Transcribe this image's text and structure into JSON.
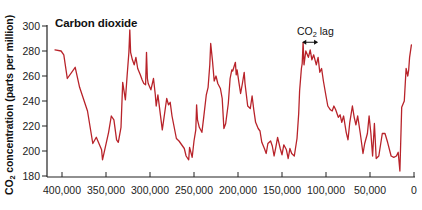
{
  "chart_data": {
    "type": "line",
    "title": "Carbon dioxide",
    "xlabel": "",
    "ylabel_prefix": "CO",
    "ylabel_sub": "2",
    "ylabel_suffix": " concentration (parts per million)",
    "ylabel": "CO2 concentration (parts per million)",
    "x_units": "years before present",
    "x_reversed": true,
    "xlim": [
      0,
      400000
    ],
    "ylim": [
      180,
      300
    ],
    "grid": false,
    "legend": null,
    "x_ticks": [
      400000,
      350000,
      300000,
      250000,
      200000,
      150000,
      100000,
      50000,
      0
    ],
    "x_tick_labels": [
      "400,000",
      "350,000",
      "300,000",
      "250,000",
      "200,000",
      "150,000",
      "100,000",
      "50,000",
      "0"
    ],
    "y_ticks": [
      180,
      200,
      220,
      240,
      260,
      280,
      300
    ],
    "y_tick_labels": [
      "180",
      "200",
      "220",
      "240",
      "260",
      "280",
      "300"
    ],
    "line_color": "#b8232a",
    "annotation": {
      "text_prefix": "CO",
      "text_sub": "2",
      "text_suffix": " lag",
      "text": "CO2 lag",
      "arrow_from_years": 127000,
      "arrow_to_years": 109000,
      "arrow_ppm": 287
    },
    "series": [
      {
        "name": "CO2 concentration",
        "points": [
          [
            408000,
            281
          ],
          [
            401000,
            280
          ],
          [
            398000,
            277
          ],
          [
            394000,
            258
          ],
          [
            385000,
            267
          ],
          [
            380000,
            251
          ],
          [
            371000,
            232
          ],
          [
            365000,
            206
          ],
          [
            361000,
            211
          ],
          [
            355000,
            201
          ],
          [
            354000,
            193
          ],
          [
            347000,
            215
          ],
          [
            344000,
            228
          ],
          [
            341000,
            225
          ],
          [
            338000,
            209
          ],
          [
            336000,
            207
          ],
          [
            333000,
            219
          ],
          [
            331000,
            255
          ],
          [
            328000,
            241
          ],
          [
            326000,
            260
          ],
          [
            324000,
            279
          ],
          [
            323000,
            297
          ],
          [
            322000,
            279
          ],
          [
            320000,
            273
          ],
          [
            318000,
            269
          ],
          [
            316000,
            275
          ],
          [
            314000,
            266
          ],
          [
            311000,
            261
          ],
          [
            309000,
            257
          ],
          [
            307000,
            254
          ],
          [
            305000,
            253
          ],
          [
            304000,
            279
          ],
          [
            303000,
            258
          ],
          [
            302000,
            254
          ],
          [
            299000,
            249
          ],
          [
            296000,
            258
          ],
          [
            294000,
            245
          ],
          [
            293000,
            236
          ],
          [
            291000,
            245
          ],
          [
            286000,
            217
          ],
          [
            281000,
            242
          ],
          [
            279000,
            237
          ],
          [
            277000,
            239
          ],
          [
            275000,
            228
          ],
          [
            270000,
            210
          ],
          [
            267000,
            208
          ],
          [
            261000,
            202
          ],
          [
            259000,
            196
          ],
          [
            256000,
            193
          ],
          [
            255000,
            203
          ],
          [
            252000,
            195
          ],
          [
            250000,
            208
          ],
          [
            248000,
            217
          ],
          [
            247000,
            237
          ],
          [
            246000,
            225
          ],
          [
            244000,
            219
          ],
          [
            241000,
            215
          ],
          [
            239000,
            227
          ],
          [
            236000,
            245
          ],
          [
            234000,
            251
          ],
          [
            232000,
            269
          ],
          [
            231000,
            286
          ],
          [
            229000,
            272
          ],
          [
            227000,
            256
          ],
          [
            225000,
            260
          ],
          [
            223000,
            254
          ],
          [
            220000,
            250
          ],
          [
            218000,
            242
          ],
          [
            216000,
            218
          ],
          [
            214000,
            222
          ],
          [
            211000,
            238
          ],
          [
            209000,
            258
          ],
          [
            207000,
            265
          ],
          [
            206000,
            264
          ],
          [
            203000,
            271
          ],
          [
            202000,
            261
          ],
          [
            201000,
            265
          ],
          [
            199000,
            255
          ],
          [
            197000,
            246
          ],
          [
            195000,
            254
          ],
          [
            193000,
            263
          ],
          [
            192000,
            254
          ],
          [
            189000,
            236
          ],
          [
            186000,
            234
          ],
          [
            184000,
            244
          ],
          [
            182000,
            233
          ],
          [
            180000,
            223
          ],
          [
            177000,
            218
          ],
          [
            175000,
            216
          ],
          [
            173000,
            207
          ],
          [
            170000,
            202
          ],
          [
            168000,
            198
          ],
          [
            166000,
            206
          ],
          [
            163000,
            208
          ],
          [
            161000,
            204
          ],
          [
            159000,
            196
          ],
          [
            157000,
            203
          ],
          [
            155000,
            211
          ],
          [
            152000,
            202
          ],
          [
            150000,
            197
          ],
          [
            148000,
            205
          ],
          [
            145000,
            201
          ],
          [
            143000,
            194
          ],
          [
            141000,
            202
          ],
          [
            139000,
            198
          ],
          [
            136000,
            196
          ],
          [
            133000,
            210
          ],
          [
            131000,
            230
          ],
          [
            130000,
            248
          ],
          [
            128000,
            266
          ],
          [
            127000,
            270
          ],
          [
            126000,
            287
          ],
          [
            125000,
            269
          ],
          [
            123000,
            280
          ],
          [
            120000,
            275
          ],
          [
            118000,
            281
          ],
          [
            116000,
            273
          ],
          [
            114000,
            277
          ],
          [
            111000,
            269
          ],
          [
            109000,
            275
          ],
          [
            107000,
            263
          ],
          [
            105000,
            266
          ],
          [
            103000,
            256
          ],
          [
            100000,
            244
          ],
          [
            98000,
            236
          ],
          [
            95000,
            233
          ],
          [
            93000,
            232
          ],
          [
            91000,
            236
          ],
          [
            89000,
            233
          ],
          [
            86000,
            227
          ],
          [
            84000,
            229
          ],
          [
            82000,
            223
          ],
          [
            80000,
            228
          ],
          [
            77000,
            215
          ],
          [
            75000,
            209
          ],
          [
            73000,
            223
          ],
          [
            70000,
            236
          ],
          [
            68000,
            227
          ],
          [
            66000,
            221
          ],
          [
            64000,
            228
          ],
          [
            61000,
            214
          ],
          [
            58000,
            198
          ],
          [
            56000,
            206
          ],
          [
            53000,
            214
          ],
          [
            51000,
            228
          ],
          [
            49000,
            214
          ],
          [
            47000,
            196
          ],
          [
            45000,
            222
          ],
          [
            43000,
            194
          ],
          [
            40000,
            196
          ],
          [
            36000,
            214
          ],
          [
            33000,
            214
          ],
          [
            30000,
            207
          ],
          [
            26000,
            196
          ],
          [
            23000,
            195
          ],
          [
            20000,
            196
          ],
          [
            18000,
            199
          ],
          [
            16000,
            184
          ],
          [
            14000,
            235
          ],
          [
            11000,
            240
          ],
          [
            9000,
            266
          ],
          [
            7000,
            260
          ],
          [
            6000,
            265
          ],
          [
            5000,
            275
          ],
          [
            3000,
            285
          ]
        ]
      }
    ]
  }
}
